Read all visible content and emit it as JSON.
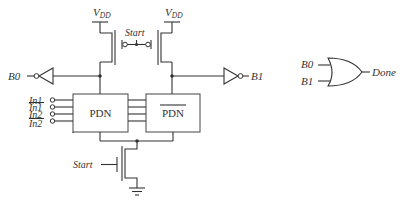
{
  "diagram": {
    "type": "circuit-schematic",
    "supply": {
      "left_label": "V",
      "left_sub": "DD",
      "right_label": "V",
      "right_sub": "DD"
    },
    "precharge": {
      "start_label": "Start"
    },
    "outputs": {
      "left": "B0",
      "right": "B1"
    },
    "inputs": [
      "In1",
      "In1",
      "In2",
      "In2"
    ],
    "inputs_overbar": [
      false,
      true,
      false,
      true
    ],
    "blocks": {
      "left": "PDN",
      "right": "PDN",
      "right_overbar": true
    },
    "evaluate": {
      "start_label": "Start"
    },
    "completion_gate": {
      "type": "OR",
      "in_a": "B0",
      "in_b": "B1",
      "out": "Done"
    }
  }
}
